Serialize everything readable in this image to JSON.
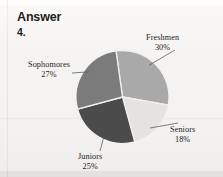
{
  "page": {
    "heading": "Answer",
    "item_number": "4."
  },
  "chart_data": {
    "type": "pie",
    "title": "",
    "subtitle": "",
    "xlabel": "",
    "ylabel": "",
    "legend_position": "none",
    "grid": false,
    "start_angle_deg": -8,
    "direction": "clockwise",
    "categories": [
      "Freshmen",
      "Seniors",
      "Juniors",
      "Sophomores"
    ],
    "values": [
      30,
      18,
      25,
      27
    ],
    "unit": "%",
    "slices": [
      {
        "name": "Freshmen",
        "value": 30,
        "label": "Freshmen",
        "percent_label": "30%",
        "color": "#a9a9a9"
      },
      {
        "name": "Seniors",
        "value": 18,
        "label": "Seniors",
        "percent_label": "18%",
        "color": "#e4e3e1"
      },
      {
        "name": "Juniors",
        "value": 25,
        "label": "Juniors",
        "percent_label": "25%",
        "color": "#4b4b4b"
      },
      {
        "name": "Sophomores",
        "value": 27,
        "label": "Sophomores",
        "percent_label": "27%",
        "color": "#7b7b7b"
      }
    ],
    "separator_color": "#f2f1ef",
    "leader_line_color": "#575757"
  }
}
